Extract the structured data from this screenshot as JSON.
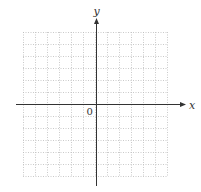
{
  "diagram": {
    "type": "cartesian-grid",
    "x_axis_label": "x",
    "y_axis_label": "y",
    "origin_label": "0",
    "grid": {
      "columns": 12,
      "rows": 12,
      "left": 23,
      "top": 32,
      "cell_size": 12,
      "line_style": "dotted",
      "line_color": "#bdbdbd"
    },
    "axes": {
      "color": "#333333",
      "origin_x": 96,
      "origin_y": 104,
      "x_start": 16,
      "x_end": 186,
      "y_start": 186,
      "y_end": 18
    }
  }
}
